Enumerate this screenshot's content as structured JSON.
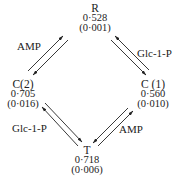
{
  "nodes": {
    "R": {
      "name": "R",
      "value": "0·528",
      "error": "(0·001)"
    },
    "C2": {
      "name": "C(2)",
      "value": "0·705",
      "error": "(0·016)"
    },
    "C1": {
      "name": "C (1)",
      "value": "0·560",
      "error": "(0·010)"
    },
    "T": {
      "name": "T",
      "value": "0·718",
      "error": "(0·006)"
    }
  },
  "edges": {
    "R_C2": {
      "label": "AMP"
    },
    "R_C1": {
      "label": "Glc-1-P"
    },
    "C2_T": {
      "label": "Glc-1-P"
    },
    "C1_T": {
      "label": "AMP"
    }
  },
  "colors": {
    "ink": "#222222",
    "background": "#ffffff"
  }
}
